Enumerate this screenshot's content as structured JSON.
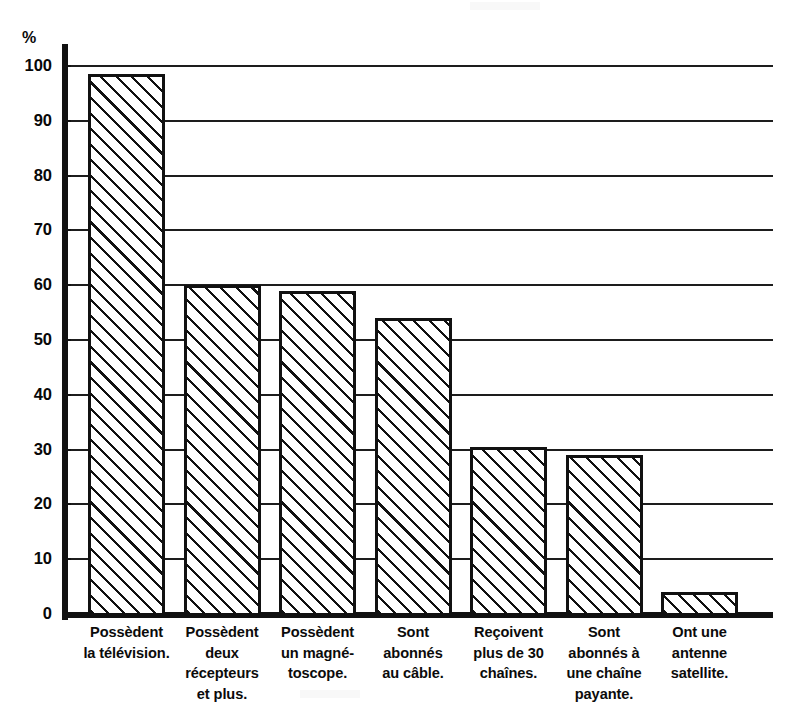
{
  "chart_data": {
    "type": "bar",
    "title": "",
    "subtitle": "",
    "xlabel": "",
    "ylabel": "%",
    "ylim": [
      0,
      100
    ],
    "grid": true,
    "legend": "none",
    "unit": "%",
    "orientation": "vertical",
    "bar_fill": "diagonal-hatch",
    "ytick_labels": [
      "100",
      "90",
      "80",
      "70",
      "60",
      "50",
      "40",
      "30",
      "20",
      "10",
      "0"
    ],
    "ytick_values": [
      100,
      90,
      80,
      70,
      60,
      50,
      40,
      30,
      20,
      10,
      0
    ],
    "categories": [
      "Possèdent la télévision.",
      "Possèdent deux récepteurs et plus.",
      "Possèdent un magnétoscope.",
      "Sont abonnés au câble.",
      "Reçoivent plus de 30 chaînes.",
      "Sont abonnés à une chaîne payante.",
      "Ont une antenne satellite."
    ],
    "category_lines": [
      [
        "Possèdent",
        "la télévision."
      ],
      [
        "Possèdent",
        "deux",
        "récepteurs",
        "et plus."
      ],
      [
        "Possèdent",
        "un magné-",
        "toscope."
      ],
      [
        "Sont",
        "abonnés",
        "au câble."
      ],
      [
        "Reçoivent",
        "plus de 30",
        "chaînes."
      ],
      [
        "Sont",
        "abonnés à",
        "une chaîne",
        "payante."
      ],
      [
        "Ont une",
        "antenne",
        "satellite."
      ]
    ],
    "values": [
      98.5,
      60,
      59,
      54,
      30.5,
      29,
      4
    ]
  },
  "colors": {
    "ink": "#111111",
    "paper": "#ffffff",
    "gridline": "#1d1d1d"
  }
}
